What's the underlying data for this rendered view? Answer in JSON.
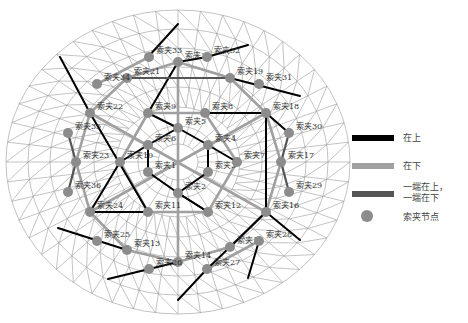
{
  "colors": {
    "grid": "#9a9a9a",
    "upper": "#000000",
    "lower": "#a0a0a0",
    "mixed": "#555555",
    "node": "#8c8c8c"
  },
  "legend": {
    "items": [
      {
        "key": "upper",
        "label": "在上"
      },
      {
        "key": "lower",
        "label": "在下"
      },
      {
        "key": "mixed",
        "label_line1": "一端在上，",
        "label_line2": "一端在下"
      },
      {
        "key": "node",
        "label": "索夹节点"
      }
    ]
  },
  "nodes": [
    {
      "id": 1,
      "label": "索夹1",
      "x": 148,
      "y": 172
    },
    {
      "id": 2,
      "label": "索夹2",
      "x": 178,
      "y": 193
    },
    {
      "id": 3,
      "label": "索夹3",
      "x": 208,
      "y": 172
    },
    {
      "id": 4,
      "label": "索夹4",
      "x": 208,
      "y": 145
    },
    {
      "id": 5,
      "label": "索夹5",
      "x": 178,
      "y": 128
    },
    {
      "id": 6,
      "label": "索夹6",
      "x": 148,
      "y": 145
    },
    {
      "id": 7,
      "label": "索夹7",
      "x": 237,
      "y": 162
    },
    {
      "id": 8,
      "label": "索夹8",
      "x": 205,
      "y": 113
    },
    {
      "id": 9,
      "label": "索夹9",
      "x": 148,
      "y": 113
    },
    {
      "id": 10,
      "label": "索夹10",
      "x": 120,
      "y": 162
    },
    {
      "id": 11,
      "label": "索夹11",
      "x": 148,
      "y": 212
    },
    {
      "id": 12,
      "label": "索夹12",
      "x": 208,
      "y": 212
    },
    {
      "id": 13,
      "label": "索夹13",
      "x": 127,
      "y": 250
    },
    {
      "id": 14,
      "label": "索夹14",
      "x": 178,
      "y": 262
    },
    {
      "id": 15,
      "label": "索夹15",
      "x": 230,
      "y": 247
    },
    {
      "id": 16,
      "label": "索夹16",
      "x": 266,
      "y": 212
    },
    {
      "id": 17,
      "label": "索夹17",
      "x": 281,
      "y": 162
    },
    {
      "id": 18,
      "label": "索夹18",
      "x": 266,
      "y": 113
    },
    {
      "id": 19,
      "label": "索夹19",
      "x": 230,
      "y": 78
    },
    {
      "id": 20,
      "label": "索夹20",
      "x": 178,
      "y": 62
    },
    {
      "id": 21,
      "label": "索夹21",
      "x": 127,
      "y": 78
    },
    {
      "id": 22,
      "label": "索夹22",
      "x": 90,
      "y": 113
    },
    {
      "id": 23,
      "label": "索夹23",
      "x": 76,
      "y": 162
    },
    {
      "id": 24,
      "label": "索夹24",
      "x": 90,
      "y": 212
    },
    {
      "id": 25,
      "label": "索夹25",
      "x": 97,
      "y": 241
    },
    {
      "id": 26,
      "label": "索夹26",
      "x": 149,
      "y": 269
    },
    {
      "id": 27,
      "label": "索夹27",
      "x": 207,
      "y": 269
    },
    {
      "id": 28,
      "label": "索夹28",
      "x": 259,
      "y": 241
    },
    {
      "id": 29,
      "label": "索夹29",
      "x": 289,
      "y": 192
    },
    {
      "id": 30,
      "label": "索夹30",
      "x": 289,
      "y": 133
    },
    {
      "id": 31,
      "label": "索夹31",
      "x": 259,
      "y": 84
    },
    {
      "id": 32,
      "label": "索夹32",
      "x": 207,
      "y": 57
    },
    {
      "id": 33,
      "label": "索夹33",
      "x": 149,
      "y": 57
    },
    {
      "id": 34,
      "label": "索夹34",
      "x": 97,
      "y": 84
    },
    {
      "id": 35,
      "label": "索夹35",
      "x": 68,
      "y": 133
    },
    {
      "id": 36,
      "label": "索夹36",
      "x": 68,
      "y": 192
    }
  ]
}
